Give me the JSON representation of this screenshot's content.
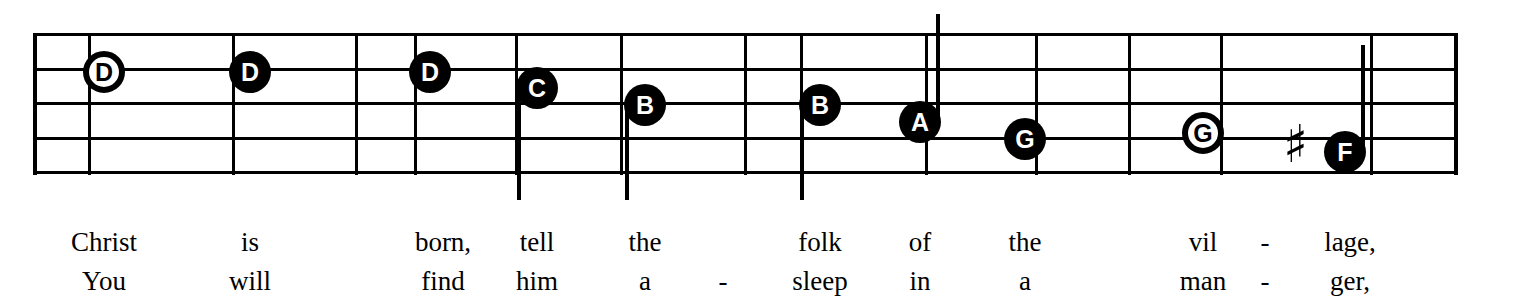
{
  "sheet": {
    "kind": "music-notation-staff",
    "ink_color": "#000000",
    "paper_color": "#ffffff"
  },
  "staff": {
    "line_count": 5,
    "left_x": 33,
    "right_x": 1455,
    "top_y": 33,
    "bottom_y": 172,
    "line_spacing": 34.5,
    "barline_x": [
      88,
      232,
      355,
      414,
      515,
      620,
      744,
      800,
      925,
      1035,
      1128,
      1220,
      1370
    ]
  },
  "notes": [
    {
      "label": "D",
      "x": 104,
      "y": 72,
      "style": "hollow",
      "stem": "none"
    },
    {
      "label": "D",
      "x": 250,
      "y": 72,
      "style": "filled",
      "stem": "none"
    },
    {
      "label": "D",
      "x": 430,
      "y": 72,
      "style": "filled",
      "stem": "none"
    },
    {
      "label": "C",
      "x": 537,
      "y": 88,
      "style": "filled",
      "stem": "down"
    },
    {
      "label": "B",
      "x": 645,
      "y": 105,
      "style": "filled",
      "stem": "down"
    },
    {
      "label": "B",
      "x": 820,
      "y": 105,
      "style": "filled",
      "stem": "down"
    },
    {
      "label": "A",
      "x": 920,
      "y": 122,
      "style": "filled",
      "stem": "up"
    },
    {
      "label": "G",
      "x": 1025,
      "y": 139,
      "style": "filled",
      "stem": "none"
    },
    {
      "label": "G",
      "x": 1203,
      "y": 133,
      "style": "hollow",
      "stem": "none"
    },
    {
      "label": "F",
      "x": 1345,
      "y": 152,
      "style": "filled",
      "stem": "up"
    }
  ],
  "accidentals": [
    {
      "symbol": "♯",
      "name": "sharp",
      "x": 1296,
      "y": 148
    }
  ],
  "lyrics": {
    "verse1_label": "verse-1",
    "verse2_label": "verse-2",
    "syllables": [
      {
        "x": 104,
        "verse1": "Christ",
        "verse2": "You"
      },
      {
        "x": 250,
        "verse1": "is",
        "verse2": "will"
      },
      {
        "x": 443,
        "verse1": "born,",
        "verse2": "find"
      },
      {
        "x": 537,
        "verse1": "tell",
        "verse2": "him"
      },
      {
        "x": 645,
        "verse1": "the",
        "verse2": "a"
      },
      {
        "x": 723,
        "verse1": "",
        "verse2": "-"
      },
      {
        "x": 820,
        "verse1": "folk",
        "verse2": "sleep"
      },
      {
        "x": 920,
        "verse1": "of",
        "verse2": "in"
      },
      {
        "x": 1025,
        "verse1": "the",
        "verse2": "a"
      },
      {
        "x": 1203,
        "verse1": "vil",
        "verse2": "man"
      },
      {
        "x": 1265,
        "verse1": "-",
        "verse2": "-"
      },
      {
        "x": 1350,
        "verse1": "lage,",
        "verse2": "ger,"
      }
    ]
  }
}
